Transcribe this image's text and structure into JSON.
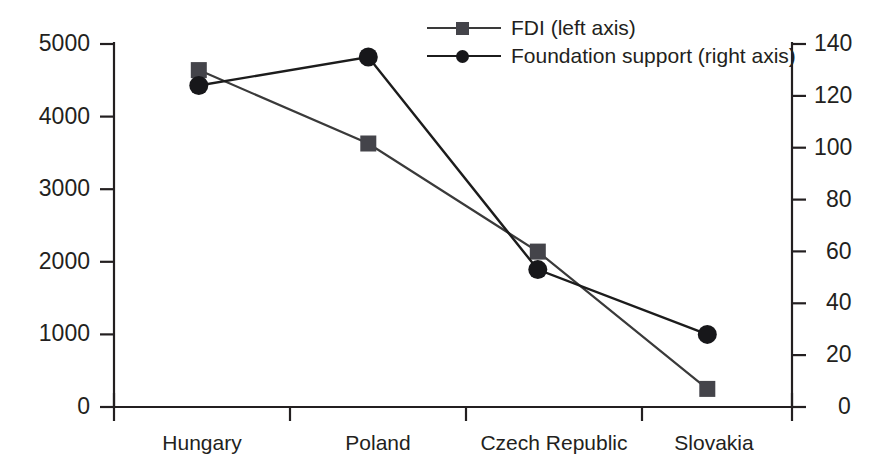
{
  "chart_data": {
    "type": "line",
    "title": "",
    "subtitle": "",
    "xlabel": "",
    "ylabel": "",
    "categories": [
      "Hungary",
      "Poland",
      "Czech Republic",
      "Slovakia"
    ],
    "grid": false,
    "legend_position": "top-right",
    "series": [
      {
        "name": "FDI (left axis)",
        "axis": "left",
        "marker": "square",
        "color": "#44444a",
        "line_color": "#3a3a3a",
        "values": [
          4640,
          3630,
          2140,
          250
        ]
      },
      {
        "name": "Foundation support (right axis)",
        "axis": "right",
        "marker": "circle",
        "color": "#17171a",
        "line_color": "#1c1c1c",
        "values": [
          124,
          135,
          53,
          28
        ]
      }
    ],
    "left_axis": {
      "label": "",
      "ylim": [
        0,
        5000
      ],
      "ticks": [
        0,
        1000,
        2000,
        3000,
        4000,
        5000
      ],
      "tick_labels": [
        "0",
        "1000",
        "2000",
        "3000",
        "4000",
        "5000"
      ]
    },
    "right_axis": {
      "label": "",
      "ylim": [
        0,
        140
      ],
      "ticks": [
        0,
        20,
        40,
        60,
        80,
        100,
        120,
        140
      ],
      "tick_labels": [
        "0",
        "20",
        "40",
        "60",
        "80",
        "100",
        "120",
        "140"
      ]
    },
    "axis_color": "#231f20"
  },
  "legend": {
    "items": [
      {
        "label": "FDI (left axis)",
        "marker": "square-marker",
        "color": "#44444a"
      },
      {
        "label": "Foundation support (right axis)",
        "marker": "circle-marker",
        "color": "#17171a"
      }
    ]
  },
  "left_tick_labels": {
    "t0": "0",
    "t1": "1000",
    "t2": "2000",
    "t3": "3000",
    "t4": "4000",
    "t5": "5000"
  },
  "right_tick_labels": {
    "t0": "0",
    "t1": "20",
    "t2": "40",
    "t3": "60",
    "t4": "80",
    "t5": "100",
    "t6": "120",
    "t7": "140"
  },
  "category_labels": {
    "c0": "Hungary",
    "c1": "Poland",
    "c2": "Czech Republic",
    "c3": "Slovakia"
  }
}
